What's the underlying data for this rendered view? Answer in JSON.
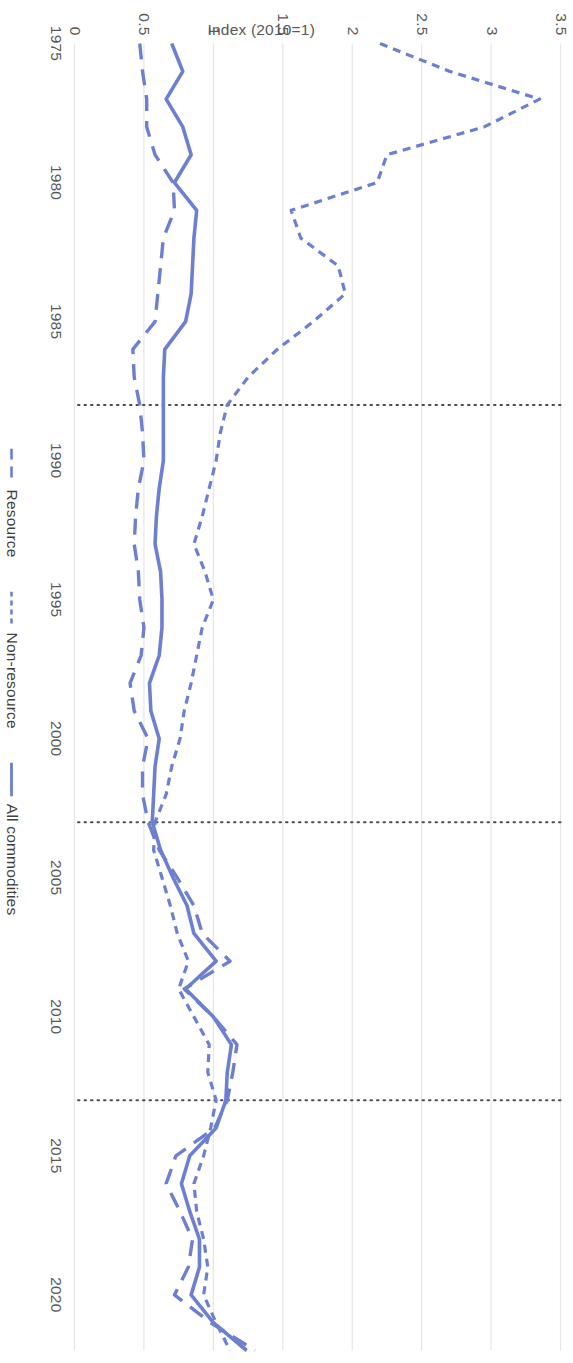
{
  "chart_data": {
    "type": "line",
    "title": "",
    "xlabel": "",
    "ylabel": "Index (2010=1)",
    "xlim": [
      1975,
      2022
    ],
    "ylim": [
      0,
      3.5
    ],
    "grid": true,
    "orientation": "rotated-90-ccw",
    "legend_position": "bottom",
    "x": [
      1975,
      1976,
      1977,
      1978,
      1979,
      1980,
      1981,
      1982,
      1983,
      1984,
      1985,
      1986,
      1987,
      1988,
      1989,
      1990,
      1991,
      1992,
      1993,
      1994,
      1995,
      1996,
      1997,
      1998,
      1999,
      2000,
      2001,
      2002,
      2003,
      2004,
      2005,
      2006,
      2007,
      2008,
      2009,
      2010,
      2011,
      2012,
      2013,
      2014,
      2015,
      2016,
      2017,
      2018,
      2019,
      2020,
      2021,
      2022
    ],
    "xticks": [
      1975,
      1980,
      1985,
      1990,
      1995,
      2000,
      2005,
      2010,
      2015,
      2020
    ],
    "xticklabels": [
      "1975",
      "1980",
      "1985",
      "1990",
      "1995",
      "2000",
      "2005",
      "2010",
      "2015",
      "2020"
    ],
    "yticks": [
      0,
      0.5,
      1,
      1.5,
      2,
      2.5,
      3,
      3.5
    ],
    "yticklabels": [
      "0",
      "0.5",
      "1",
      "1.5",
      "2",
      "2.5",
      "3",
      "3.5"
    ],
    "series": [
      {
        "name": "Resource",
        "style": "dashed-long",
        "color": "#6C7FD1",
        "values": [
          0.47,
          0.49,
          0.52,
          0.52,
          0.58,
          0.71,
          0.72,
          0.64,
          0.62,
          0.6,
          0.58,
          0.42,
          0.43,
          0.47,
          0.49,
          0.5,
          0.46,
          0.44,
          0.43,
          0.46,
          0.47,
          0.5,
          0.48,
          0.4,
          0.43,
          0.53,
          0.49,
          0.49,
          0.53,
          0.61,
          0.74,
          0.86,
          0.92,
          1.12,
          0.79,
          1.0,
          1.17,
          1.14,
          1.1,
          1.01,
          0.73,
          0.66,
          0.76,
          0.85,
          0.82,
          0.72,
          0.98,
          1.3
        ]
      },
      {
        "name": "Non-resource",
        "style": "dashed-short",
        "color": "#6C7FD1",
        "values": [
          2.2,
          2.7,
          3.35,
          2.95,
          2.25,
          2.18,
          1.56,
          1.63,
          1.9,
          1.95,
          1.72,
          1.46,
          1.25,
          1.1,
          1.05,
          1.02,
          0.97,
          0.92,
          0.86,
          0.94,
          1.0,
          0.92,
          0.88,
          0.84,
          0.79,
          0.76,
          0.7,
          0.66,
          0.58,
          0.57,
          0.63,
          0.69,
          0.74,
          0.82,
          0.75,
          0.86,
          0.97,
          0.96,
          1.02,
          0.98,
          0.93,
          0.86,
          0.88,
          0.93,
          0.96,
          0.93,
          1.02,
          1.12
        ]
      },
      {
        "name": "All commodities",
        "style": "solid",
        "color": "#6C7FD1",
        "values": [
          0.7,
          0.78,
          0.66,
          0.78,
          0.84,
          0.72,
          0.88,
          0.86,
          0.85,
          0.84,
          0.8,
          0.65,
          0.64,
          0.64,
          0.64,
          0.64,
          0.61,
          0.59,
          0.58,
          0.62,
          0.63,
          0.63,
          0.61,
          0.54,
          0.55,
          0.61,
          0.58,
          0.57,
          0.56,
          0.62,
          0.71,
          0.81,
          0.86,
          1.02,
          0.8,
          1.0,
          1.13,
          1.1,
          1.09,
          1.02,
          0.83,
          0.77,
          0.83,
          0.9,
          0.9,
          0.84,
          1.0,
          1.24
        ]
      }
    ],
    "reference_lines": [
      {
        "x": 1988,
        "style": "dotted"
      },
      {
        "x": 2003,
        "style": "dotted"
      },
      {
        "x": 2013,
        "style": "dotted"
      }
    ]
  },
  "legend": {
    "items": [
      {
        "label": "Resource",
        "swatch": "dashed-long-swatch"
      },
      {
        "label": "Non-resource",
        "swatch": "dashed-short-swatch"
      },
      {
        "label": "All commodities",
        "swatch": "solid-line-swatch"
      }
    ]
  },
  "colors": {
    "line": "#6C7FD1",
    "grid": "#E6E6E6",
    "reference": "#4D4D4D",
    "tick_text": "#595959"
  }
}
